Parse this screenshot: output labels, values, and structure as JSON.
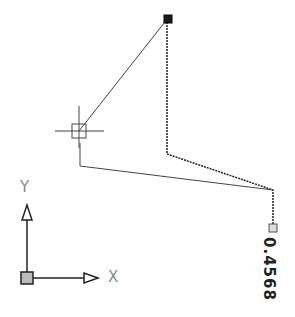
{
  "drawing": {
    "dimension_value": "0.4568",
    "colors": {
      "line": "#333333",
      "grip_selected": "#1a1a1a",
      "grip_unselected": "#cccccc",
      "axis_label": "#888888"
    }
  },
  "ucs": {
    "x_label": "X",
    "y_label": "Y"
  },
  "crosshair": {
    "x": 79,
    "y": 131
  }
}
